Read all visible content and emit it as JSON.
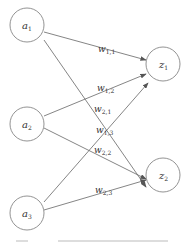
{
  "diagram": {
    "type": "neural-network",
    "inputs": [
      {
        "id": "a1",
        "label": "a",
        "sub": "1"
      },
      {
        "id": "a2",
        "label": "a",
        "sub": "2"
      },
      {
        "id": "a3",
        "label": "a",
        "sub": "3"
      }
    ],
    "outputs": [
      {
        "id": "z1",
        "label": "z",
        "sub": "1"
      },
      {
        "id": "z2",
        "label": "z",
        "sub": "2"
      }
    ],
    "weights": [
      {
        "from": "a1",
        "to": "z1",
        "label": "w",
        "sub": "1,1"
      },
      {
        "from": "a2",
        "to": "z1",
        "label": "w",
        "sub": "1,2"
      },
      {
        "from": "a3",
        "to": "z1",
        "label": "w",
        "sub": "1,3"
      },
      {
        "from": "a1",
        "to": "z2",
        "label": "w",
        "sub": "2,1"
      },
      {
        "from": "a2",
        "to": "z2",
        "label": "w",
        "sub": "2,2"
      },
      {
        "from": "a3",
        "to": "z2",
        "label": "w",
        "sub": "2,3"
      }
    ]
  }
}
